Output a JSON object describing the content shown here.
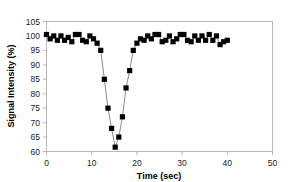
{
  "chart_data": {
    "type": "line",
    "title": "",
    "xlabel": "Time (sec)",
    "ylabel": "Signal Intensity (%)",
    "xlim": [
      0,
      50
    ],
    "ylim": [
      60,
      105
    ],
    "xticks": [
      0,
      10,
      20,
      30,
      40,
      50
    ],
    "yticks": [
      60,
      65,
      70,
      75,
      80,
      85,
      90,
      95,
      100,
      105
    ],
    "grid": false,
    "legend": "none",
    "marker": "square",
    "marker_color": "#000000",
    "line_color": "#6d6d6d",
    "x": [
      0,
      0.8,
      1.6,
      2.4,
      3.2,
      4.0,
      4.8,
      5.6,
      6.4,
      7.2,
      8.0,
      8.8,
      9.6,
      10.4,
      11.2,
      12.0,
      12.8,
      13.6,
      14.4,
      15.2,
      16.0,
      16.8,
      17.6,
      18.4,
      19.2,
      20.0,
      20.8,
      21.6,
      22.4,
      23.2,
      24.0,
      24.8,
      25.6,
      26.4,
      27.2,
      28.0,
      28.8,
      29.6,
      30.4,
      31.2,
      32.0,
      32.8,
      33.6,
      34.4,
      35.2,
      36.0,
      36.8,
      37.6,
      38.4,
      39.2,
      40.0
    ],
    "y": [
      100.5,
      99.0,
      100.0,
      98.5,
      100.0,
      98.5,
      99.5,
      98.0,
      100.5,
      100.5,
      98.5,
      98.0,
      100.0,
      99.0,
      97.5,
      95.0,
      85.0,
      75.0,
      68.0,
      61.5,
      65.0,
      72.0,
      82.0,
      88.0,
      95.0,
      97.5,
      99.0,
      98.5,
      100.0,
      99.0,
      100.5,
      100.5,
      98.0,
      98.5,
      100.0,
      98.0,
      99.0,
      100.5,
      100.5,
      98.5,
      98.0,
      100.0,
      98.5,
      100.0,
      98.5,
      100.5,
      98.5,
      100.0,
      97.0,
      98.0,
      98.5
    ]
  },
  "axes": {
    "y_title": "Signal Intensity (%)",
    "x_title": "Time (sec)",
    "y_tick_labels": [
      "105",
      "100",
      "95",
      "90",
      "85",
      "80",
      "75",
      "70",
      "65",
      "60"
    ],
    "x_tick_labels": [
      "0",
      "10",
      "20",
      "30",
      "40",
      "50"
    ]
  }
}
